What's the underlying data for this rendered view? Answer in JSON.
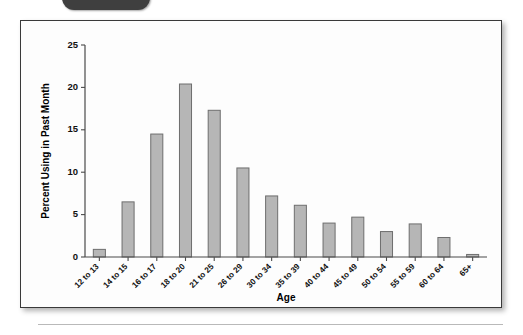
{
  "page": {
    "tab_icon": "dark-tab-marker"
  },
  "chart_data": {
    "type": "bar",
    "title": "",
    "xlabel": "Age",
    "ylabel": "Percent Using in Past Month",
    "categories": [
      "12 to 13",
      "14 to 15",
      "16 to 17",
      "18 to 20",
      "21 to 25",
      "26 to 29",
      "30 to 34",
      "35 to 39",
      "40 to 44",
      "45 to 49",
      "50 to 54",
      "55 to 59",
      "60 to 64",
      "65+"
    ],
    "values": [
      0.9,
      6.5,
      14.5,
      20.4,
      17.3,
      10.5,
      7.2,
      6.1,
      4.0,
      4.7,
      3.0,
      3.9,
      2.3,
      0.3
    ],
    "ylim": [
      0,
      25
    ],
    "yticks": [
      0,
      5,
      10,
      15,
      20,
      25
    ],
    "ytick_labels": [
      "0",
      "5",
      "10",
      "15",
      "20",
      "25"
    ],
    "grid": false,
    "legend": "none",
    "bar_fill": "#b6b6b6",
    "bar_stroke": "#6e6e6e"
  }
}
